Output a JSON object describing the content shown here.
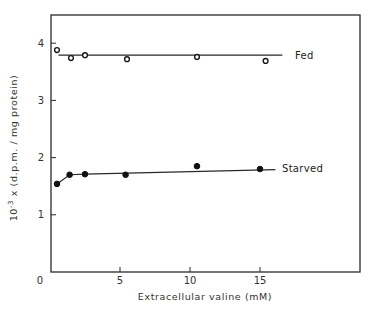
{
  "chart_data": {
    "type": "scatter",
    "title": "",
    "xlabel": "Extracellular valine (mM)",
    "ylabel": "10⁻³ x (d.p.m./mg protein)",
    "xlim": [
      0,
      22
    ],
    "ylim": [
      0,
      4.5
    ],
    "x_ticks": [
      0,
      5,
      10,
      15
    ],
    "x_tick_labels": [
      "0",
      "5",
      "10",
      "15"
    ],
    "y_ticks": [
      1,
      2,
      3,
      4
    ],
    "y_tick_labels": [
      "1",
      "2",
      "3",
      "4"
    ],
    "grid": false,
    "legend": "inline labels at line ends",
    "series": [
      {
        "name": "Fed",
        "marker": "open-circle",
        "x": [
          0.5,
          1.5,
          2.5,
          5.5,
          10.5,
          15.4
        ],
        "y": [
          3.88,
          3.74,
          3.79,
          3.72,
          3.76,
          3.69
        ],
        "fit_line": {
          "x": [
            0.6,
            16.6
          ],
          "y": [
            3.79,
            3.79
          ]
        }
      },
      {
        "name": "Starved",
        "marker": "filled-circle",
        "x": [
          0.5,
          1.4,
          2.5,
          5.4,
          10.5,
          15.0
        ],
        "y": [
          1.54,
          1.7,
          1.71,
          1.7,
          1.85,
          1.8
        ],
        "fit_line": {
          "x": [
            0.5,
            1.4,
            2.5,
            16.1
          ],
          "y": [
            1.54,
            1.7,
            1.71,
            1.79
          ]
        }
      }
    ]
  },
  "labels": {
    "x_zero": "0",
    "fed": "Fed",
    "starved": "Starved",
    "ylabel_prefix": "10",
    "ylabel_exp": "-3",
    "ylabel_rest": " x  (d.p.m. / mg protein)"
  }
}
